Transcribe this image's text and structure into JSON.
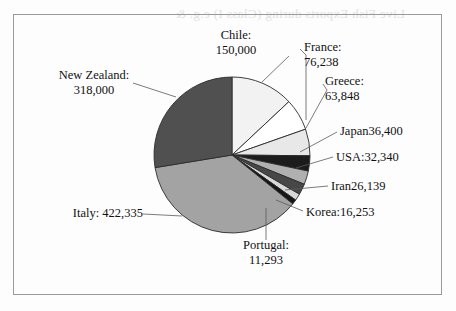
{
  "page": {
    "background_color": "#fdfdfd",
    "frame_color": "#9a9a9a",
    "bleed_text": "Live Fish Exports during (Class I) e.g. &"
  },
  "chart_data": {
    "type": "pie",
    "title": "",
    "subtitle": "",
    "xlabel": "",
    "ylabel": "",
    "legend_position": "none",
    "grid": false,
    "total": 1173046,
    "start_angle_deg": 0,
    "direction": "clockwise",
    "categories": [
      "Chile",
      "France",
      "Greece",
      "Japan",
      "USA",
      "Iran",
      "Korea",
      "Portugal",
      "Italy",
      "New Zealand"
    ],
    "values": [
      150000,
      76238,
      63848,
      36400,
      32340,
      26139,
      16253,
      11293,
      422335,
      318000
    ],
    "slices": [
      {
        "name": "Chile",
        "value": 150000,
        "value_text": "150,000",
        "label_line1": "Chile:",
        "label_line2": "150,000",
        "color": "#f2f2f2"
      },
      {
        "name": "France",
        "value": 76238,
        "value_text": "76,238",
        "label_line1": "France:",
        "label_line2": "76,238",
        "color": "#ffffff"
      },
      {
        "name": "Greece",
        "value": 63848,
        "value_text": "63,848",
        "label_line1": "Greece:",
        "label_line2": "63,848",
        "color": "#e8e8e8"
      },
      {
        "name": "Japan",
        "value": 36400,
        "value_text": "36,400",
        "label_line1": "Japan36,400",
        "label_line2": "",
        "color": "#1c1c1c"
      },
      {
        "name": "USA",
        "value": 32340,
        "value_text": "32,340",
        "label_line1": "USA:32,340",
        "label_line2": "",
        "color": "#b0b0b0"
      },
      {
        "name": "Iran",
        "value": 26139,
        "value_text": "26,139",
        "label_line1": "Iran26,139",
        "label_line2": "",
        "color": "#474747"
      },
      {
        "name": "Korea",
        "value": 16253,
        "value_text": "16,253",
        "label_line1": "Korea:16,253",
        "label_line2": "",
        "color": "#d8d8d8"
      },
      {
        "name": "Portugal",
        "value": 11293,
        "value_text": "11,293",
        "label_line1": "Portugal:",
        "label_line2": "11,293",
        "color": "#151515"
      },
      {
        "name": "Italy",
        "value": 422335,
        "value_text": "422,335",
        "label_line1": "Italy: 422,335",
        "label_line2": "",
        "color": "#a3a3a3"
      },
      {
        "name": "New Zealand",
        "value": 318000,
        "value_text": "318,000",
        "label_line1": "New Zealand:",
        "label_line2": "318,000",
        "color": "#505050"
      }
    ]
  }
}
